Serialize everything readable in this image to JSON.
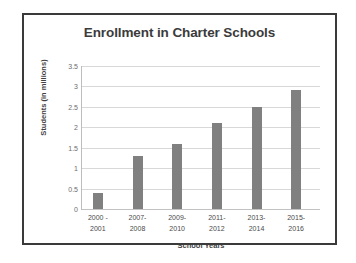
{
  "chart_data": {
    "type": "bar",
    "title": "Enrollment in Charter Schools",
    "xlabel": "School Years",
    "ylabel": "Students (in millions)",
    "categories": [
      "2000 - 2001",
      "2007-2008",
      "2009-2010",
      "2011-2012",
      "2013-2014",
      "2015-2016"
    ],
    "category_lines": [
      [
        "2000 -",
        "2001"
      ],
      [
        "2007-",
        "2008"
      ],
      [
        "2009-",
        "2010"
      ],
      [
        "2011-",
        "2012"
      ],
      [
        "2013-",
        "2014"
      ],
      [
        "2015-",
        "2016"
      ]
    ],
    "values": [
      0.4,
      1.3,
      1.6,
      2.1,
      2.5,
      2.92
    ],
    "ylim": [
      0,
      3.5
    ],
    "ytick_labels": [
      "3.5",
      "3",
      "2.5",
      "2",
      "1.5",
      "1",
      "0.5",
      "0"
    ],
    "ytick_values": [
      3.5,
      3,
      2.5,
      2,
      1.5,
      1,
      0.5,
      0
    ],
    "grid": true,
    "legend": "none",
    "bar_color": "#808080",
    "grid_color": "#d8d8d8",
    "frame_color": "#3a3a3a",
    "background": "#ffffff"
  }
}
